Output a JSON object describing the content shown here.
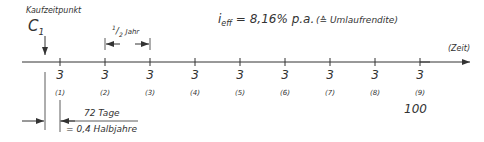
{
  "purchase": {
    "label": "Kaufzeitpunkt",
    "symbol": "C",
    "subscript": "1"
  },
  "half_year": {
    "numerator": "1",
    "denominator": "2",
    "unit": "Jahr"
  },
  "rate": {
    "prefix": "i",
    "subscript": "eff",
    "value": " = 8,16% p.a.",
    "note": "(≙ Umlaufrendite)"
  },
  "axis": {
    "label": "(Zeit)"
  },
  "cashflows": [
    {
      "value": "3",
      "index": "(1)"
    },
    {
      "value": "3",
      "index": "(2)"
    },
    {
      "value": "3",
      "index": "(3)"
    },
    {
      "value": "3",
      "index": "(4)"
    },
    {
      "value": "3",
      "index": "(5)"
    },
    {
      "value": "3",
      "index": "(6)"
    },
    {
      "value": "3",
      "index": "(7)"
    },
    {
      "value": "3",
      "index": "(8)"
    },
    {
      "value": "3",
      "index": "(9)"
    }
  ],
  "redemption": "100",
  "offset": {
    "days": "72 Tage",
    "halfyears": "= 0,4 Halbjahre"
  }
}
